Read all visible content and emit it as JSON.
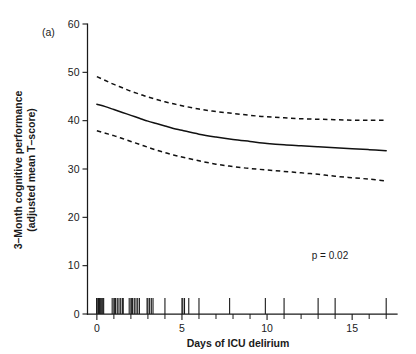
{
  "figure": {
    "panel_label": "(a)",
    "background_color": "#ffffff",
    "line_color": "#111111"
  },
  "chart_data": {
    "type": "line",
    "title": "",
    "subtitle": "",
    "panel": "(a)",
    "xlabel": "Days of ICU delirium",
    "ylabel": "3–Month cognitive performance (adjusted mean T–score)",
    "ylabel_line1": "3–Month cognitive performance",
    "ylabel_line2": "(adjusted mean T–score)",
    "xlim": [
      -0.55,
      17.4
    ],
    "ylim": [
      0,
      60
    ],
    "xticks": [
      0,
      5,
      10,
      15
    ],
    "xtick_labels": [
      "0",
      "5",
      "10",
      "15"
    ],
    "xticks_minor": [
      1,
      2,
      3,
      4,
      6,
      7,
      8,
      9,
      11,
      12,
      13,
      14,
      16,
      17
    ],
    "yticks": [
      0,
      10,
      20,
      30,
      40,
      50,
      60
    ],
    "ytick_labels": [
      "0",
      "10",
      "20",
      "30",
      "40",
      "50",
      "60"
    ],
    "grid": false,
    "legend": false,
    "annotations": [
      {
        "text": "p = 0.02",
        "x": 12.2,
        "y": 9.6
      }
    ],
    "x": [
      0,
      0.5,
      1,
      1.5,
      2,
      2.5,
      3,
      3.5,
      4,
      4.5,
      5,
      6,
      7,
      8,
      9,
      10,
      11,
      12,
      13,
      14,
      15,
      16,
      17
    ],
    "series": [
      {
        "name": "Adjusted mean T-score (fitted)",
        "style": "solid",
        "values": [
          43.4,
          42.9,
          42.3,
          41.7,
          41.1,
          40.5,
          39.9,
          39.4,
          38.9,
          38.4,
          38.0,
          37.2,
          36.6,
          36.1,
          35.7,
          35.3,
          35.0,
          34.8,
          34.6,
          34.4,
          34.2,
          34.0,
          33.8
        ]
      },
      {
        "name": "Upper 95% confidence limit",
        "style": "dashed",
        "values": [
          49.1,
          48.3,
          47.5,
          46.8,
          46.1,
          45.5,
          44.9,
          44.4,
          43.9,
          43.5,
          43.1,
          42.4,
          41.9,
          41.5,
          41.1,
          40.8,
          40.6,
          40.4,
          40.3,
          40.2,
          40.1,
          40.1,
          40.1
        ]
      },
      {
        "name": "Lower 95% confidence limit",
        "style": "dashed",
        "values": [
          37.9,
          37.4,
          36.9,
          36.3,
          35.7,
          35.1,
          34.5,
          33.9,
          33.4,
          32.9,
          32.5,
          31.7,
          31.0,
          30.5,
          30.1,
          29.8,
          29.5,
          29.2,
          28.9,
          28.5,
          28.2,
          27.9,
          27.5
        ]
      }
    ],
    "rug": {
      "name": "Observation rug marks",
      "y_top": 3.3,
      "y_bottom": 0,
      "values": [
        0,
        0,
        0,
        0.1,
        0.15,
        0.2,
        0.25,
        0.3,
        0.35,
        0.4,
        0.9,
        1.0,
        1.05,
        1.1,
        1.2,
        1.3,
        1.4,
        1.5,
        1.55,
        1.9,
        2.0,
        2.05,
        2.1,
        2.2,
        2.3,
        2.4,
        2.5,
        2.95,
        3.0,
        3.1,
        3.2,
        3.3,
        4.0,
        5.0,
        5.05,
        5.15,
        5.4,
        6.0,
        7.8,
        9.9,
        11.0,
        13.0,
        14.0,
        17.0
      ]
    }
  }
}
